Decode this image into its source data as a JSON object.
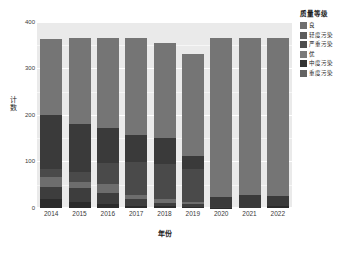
{
  "chart_data": {
    "type": "bar",
    "stacked": true,
    "title": "",
    "xlabel": "年份",
    "ylabel": "计数",
    "categories": [
      "2014",
      "2015",
      "2016",
      "2017",
      "2018",
      "2019",
      "2020",
      "2021",
      "2022"
    ],
    "ylim": [
      0,
      400
    ],
    "yticks": [
      0,
      100,
      200,
      300,
      400
    ],
    "ytick_labels": [
      "0",
      "100",
      "200",
      "300",
      "400"
    ],
    "grid": true,
    "legend_position": "right",
    "legend_title": "质量等级",
    "series": [
      {
        "name": "严重污染",
        "color": "#2b2b2b",
        "values": [
          20,
          14,
          8,
          5,
          4,
          3,
          1,
          0,
          4
        ]
      },
      {
        "name": "重度污染",
        "color": "#3d3d3d",
        "values": [
          26,
          28,
          24,
          14,
          6,
          5,
          1,
          0,
          0
        ]
      },
      {
        "name": "中度污染",
        "color": "#6d6d6d",
        "values": [
          21,
          13,
          19,
          10,
          9,
          4,
          0,
          0,
          0
        ]
      },
      {
        "name": "轻度污染",
        "color": "#4a4a4a",
        "values": [
          16,
          23,
          46,
          70,
          75,
          71,
          0,
          0,
          0
        ]
      },
      {
        "name": "良",
        "color": "#3a3a3a",
        "values": [
          117,
          103,
          76,
          59,
          56,
          30,
          22,
          27,
          21
        ]
      },
      {
        "name": "优",
        "color": "#757575",
        "values": [
          163,
          184,
          192,
          207,
          205,
          219,
          341,
          338,
          340
        ]
      }
    ],
    "totals": [
      363,
      365,
      365,
      365,
      355,
      332,
      365,
      365,
      365
    ]
  },
  "legend": {
    "title": "质量等级",
    "items": [
      {
        "label": "良",
        "color": "#6f6f6f"
      },
      {
        "label": "轻度污染",
        "color": "#5c5c5c"
      },
      {
        "label": "严重污染",
        "color": "#4d4d4d"
      },
      {
        "label": "优",
        "color": "#7a7a7a"
      },
      {
        "label": "中度污染",
        "color": "#333333"
      },
      {
        "label": "重度污染",
        "color": "#636363"
      }
    ]
  },
  "axes": {
    "y_title": "计数",
    "x_title": "年份",
    "y_tick_labels": [
      "0",
      "100",
      "200",
      "300",
      "400"
    ],
    "x_tick_labels": [
      "2014",
      "2015",
      "2016",
      "2017",
      "2018",
      "2019",
      "2020",
      "2021",
      "2022"
    ]
  },
  "colors": {
    "panel_background": "#eaeaea",
    "gridline": "#ffffff",
    "page_background": "#ffffff",
    "text": "#1a1a1a"
  }
}
